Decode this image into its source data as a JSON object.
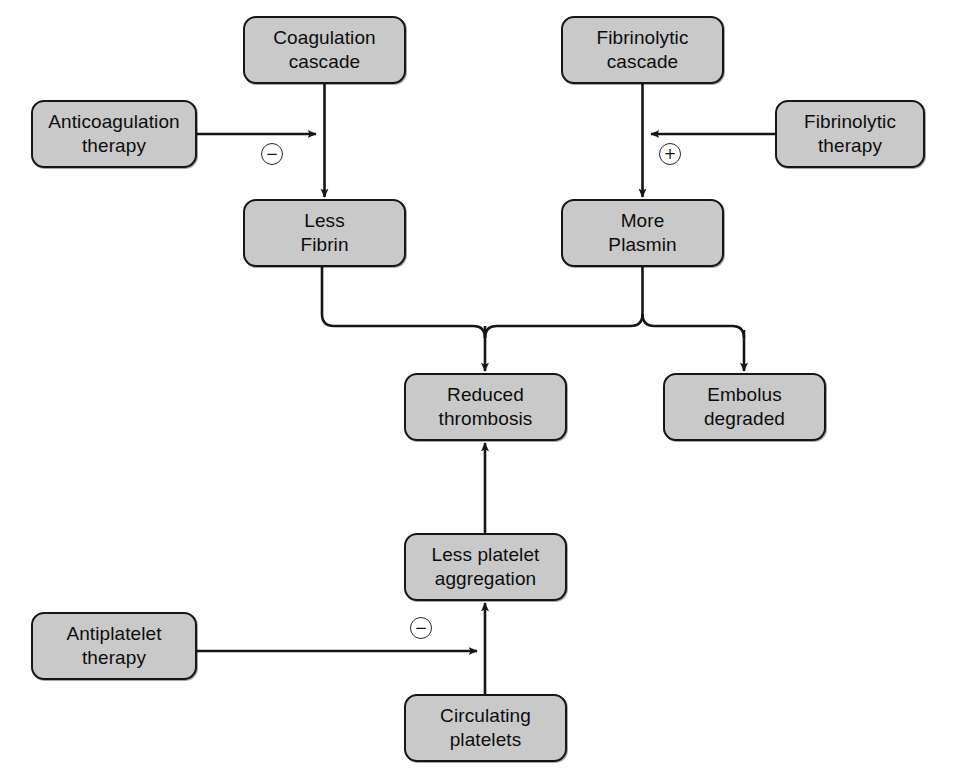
{
  "diagram": {
    "background_color": "#ffffff",
    "node_fill_color": "#c9c9c9",
    "node_border_color": "#161616",
    "edge_color": "#161616",
    "nodes": [
      {
        "id": "coagulation-cascade",
        "label": "Coagulation\ncascade",
        "x": 243,
        "y": 16,
        "w": 163,
        "h": 68
      },
      {
        "id": "fibrinolytic-cascade",
        "label": "Fibrinolytic\ncascade",
        "x": 561,
        "y": 16,
        "w": 163,
        "h": 68
      },
      {
        "id": "anticoagulation-therapy",
        "label": "Anticoagulation\ntherapy",
        "x": 31,
        "y": 100,
        "w": 166,
        "h": 68
      },
      {
        "id": "fibrinolytic-therapy",
        "label": "Fibrinolytic\ntherapy",
        "x": 775,
        "y": 100,
        "w": 150,
        "h": 68
      },
      {
        "id": "less-fibrin",
        "label": "Less\nFibrin",
        "x": 243,
        "y": 199,
        "w": 163,
        "h": 68
      },
      {
        "id": "more-plasmin",
        "label": "More\nPlasmin",
        "x": 561,
        "y": 199,
        "w": 163,
        "h": 68
      },
      {
        "id": "reduced-thrombosis",
        "label": "Reduced\nthrombosis",
        "x": 404,
        "y": 373,
        "w": 163,
        "h": 68
      },
      {
        "id": "embolus-degraded",
        "label": "Embolus\ndegraded",
        "x": 663,
        "y": 373,
        "w": 163,
        "h": 68
      },
      {
        "id": "less-platelet-aggregation",
        "label": "Less platelet\naggregation",
        "x": 404,
        "y": 533,
        "w": 163,
        "h": 68
      },
      {
        "id": "antiplatelet-therapy",
        "label": "Antiplatelet\ntherapy",
        "x": 31,
        "y": 612,
        "w": 166,
        "h": 68
      },
      {
        "id": "circulating-platelets",
        "label": "Circulating\nplatelets",
        "x": 404,
        "y": 694,
        "w": 163,
        "h": 68
      }
    ],
    "signs": [
      {
        "id": "minus-coagulation",
        "symbol": "−",
        "meaning": "inhibition",
        "x": 261,
        "y": 143
      },
      {
        "id": "plus-fibrinolytic",
        "symbol": "+",
        "meaning": "stimulation",
        "x": 659,
        "y": 143
      },
      {
        "id": "minus-antiplatelet",
        "symbol": "−",
        "meaning": "inhibition",
        "x": 410,
        "y": 617
      }
    ],
    "edges": [
      {
        "id": "coagulation-to-less-fibrin",
        "from": "coagulation-cascade",
        "to": "less-fibrin"
      },
      {
        "id": "anticoagulation-to-coagulation-arm",
        "from": "anticoagulation-therapy",
        "to": "coagulation-arrow",
        "sign": "minus-coagulation"
      },
      {
        "id": "fibrinolytic-to-more-plasmin",
        "from": "fibrinolytic-cascade",
        "to": "more-plasmin"
      },
      {
        "id": "fibrinolytic-therapy-to-arm",
        "from": "fibrinolytic-therapy",
        "to": "fibrinolytic-arrow",
        "sign": "plus-fibrinolytic"
      },
      {
        "id": "less-fibrin-to-reduced-thrombosis",
        "from": "less-fibrin",
        "to": "reduced-thrombosis"
      },
      {
        "id": "more-plasmin-to-reduced-thrombosis",
        "from": "more-plasmin",
        "to": "reduced-thrombosis"
      },
      {
        "id": "more-plasmin-to-embolus-degraded",
        "from": "more-plasmin",
        "to": "embolus-degraded"
      },
      {
        "id": "less-platelet-to-reduced-thrombosis",
        "from": "less-platelet-aggregation",
        "to": "reduced-thrombosis"
      },
      {
        "id": "circulating-to-less-platelet",
        "from": "circulating-platelets",
        "to": "less-platelet-aggregation"
      },
      {
        "id": "antiplatelet-to-platelet-arm",
        "from": "antiplatelet-therapy",
        "to": "platelet-arrow",
        "sign": "minus-antiplatelet"
      }
    ]
  }
}
